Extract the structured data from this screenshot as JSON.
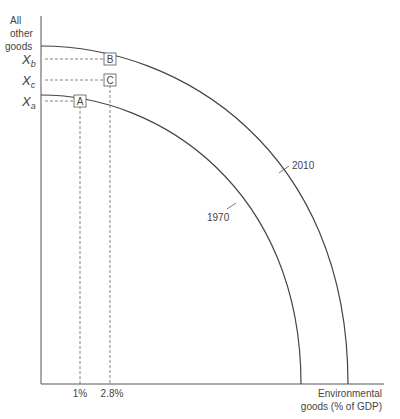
{
  "diagram": {
    "type": "production-possibilities-frontier",
    "y_axis_label": [
      "All",
      "other",
      "goods"
    ],
    "x_axis_label": [
      "Environmental",
      "goods (% of GDP)"
    ],
    "y_ticks": [
      {
        "label": "X",
        "sub": "b"
      },
      {
        "label": "X",
        "sub": "c"
      },
      {
        "label": "X",
        "sub": "a"
      }
    ],
    "x_ticks": [
      "1%",
      "2.8%"
    ],
    "curves": [
      {
        "name": "1970",
        "label": "1970"
      },
      {
        "name": "2010",
        "label": "2010"
      }
    ],
    "points": [
      "A",
      "B",
      "C"
    ],
    "colors": {
      "line": "#444444",
      "dashed": "#666666",
      "text": "#444444"
    }
  }
}
